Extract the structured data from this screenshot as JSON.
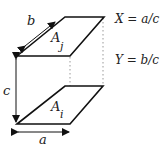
{
  "diagram": {
    "labels": {
      "b": "b",
      "c": "c",
      "a": "a",
      "Aj_main": "A",
      "Aj_sub": "j",
      "Ai_main": "A",
      "Ai_sub": "i"
    },
    "equations": {
      "x_eq": "X = a/c",
      "y_eq": "Y = b/c"
    },
    "colors": {
      "stroke": "#111111",
      "dotted": "#999999",
      "text": "#222222"
    }
  }
}
